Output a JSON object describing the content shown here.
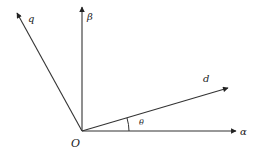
{
  "diagram": {
    "type": "vector-coordinate-frame",
    "origin": {
      "label": "O",
      "x": 82,
      "y": 131
    },
    "axes": [
      {
        "name": "alpha-axis",
        "label": "α",
        "tip": {
          "x": 236,
          "y": 131
        },
        "label_pos": {
          "x": 240,
          "y": 135
        }
      },
      {
        "name": "beta-axis",
        "label": "β",
        "tip": {
          "x": 82,
          "y": 7
        },
        "label_pos": {
          "x": 87,
          "y": 20
        }
      },
      {
        "name": "d-axis",
        "label": "d",
        "tip": {
          "x": 228,
          "y": 88
        },
        "label_pos": {
          "x": 203,
          "y": 82
        }
      },
      {
        "name": "q-axis",
        "label": "q",
        "tip": {
          "x": 17,
          "y": 13
        },
        "label_pos": {
          "x": 28,
          "y": 22
        }
      }
    ],
    "angle": {
      "label": "θ",
      "between": [
        "alpha-axis",
        "d-axis"
      ],
      "label_pos": {
        "x": 139,
        "y": 125
      }
    },
    "colors": {
      "stroke": "#333333",
      "text": "#222222"
    }
  }
}
